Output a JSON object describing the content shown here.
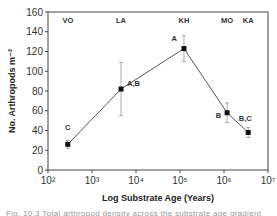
{
  "chart_data": {
    "type": "line",
    "title": "",
    "xlabel": "Log Substrate Age (Years)",
    "ylabel": "No. Arthropods m⁻²",
    "xscale": "log",
    "xlim": [
      100,
      10000000
    ],
    "ylim": [
      0,
      160
    ],
    "x_tick_labels": [
      "10²",
      "10³",
      "10⁴",
      "10⁵",
      "10⁶",
      "10⁷"
    ],
    "x_tick_exponents": [
      2,
      3,
      4,
      5,
      6,
      7
    ],
    "y_ticks": [
      0,
      20,
      40,
      60,
      80,
      100,
      120,
      140,
      160
    ],
    "grid": false,
    "legend": null,
    "series": [
      {
        "name": "Arthropod density",
        "points": [
          {
            "site": "VO",
            "x": 300,
            "log_x": 2.45,
            "y": 26,
            "err": 4,
            "group": "C"
          },
          {
            "site": "LA",
            "x": 4600,
            "log_x": 3.66,
            "y": 82,
            "err": 27,
            "group": "A,B"
          },
          {
            "site": "KH",
            "x": 150000,
            "log_x": 5.09,
            "y": 123,
            "err": 13,
            "group": "A"
          },
          {
            "site": "MO",
            "x": 1400000,
            "log_x": 6.07,
            "y": 58,
            "err": 10,
            "group": "B"
          },
          {
            "site": "KA",
            "x": 4100000,
            "log_x": 6.55,
            "y": 38,
            "err": 5,
            "group": "B,C"
          }
        ]
      }
    ],
    "site_labels": [
      "VO",
      "LA",
      "KH",
      "MO",
      "KA"
    ],
    "annotations": [
      "C",
      "A,B",
      "A",
      "B",
      "B,C"
    ]
  },
  "caption": "Fig. 10.3  Total arthropod density across the substrate age gradient"
}
